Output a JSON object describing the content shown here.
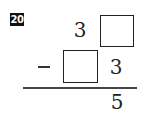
{
  "problem": {
    "number": "20",
    "top_row": {
      "tens": "3",
      "ones_blank": ""
    },
    "operator": "−",
    "bottom_row": {
      "tens_blank": "",
      "ones": "3"
    },
    "result": {
      "ones": "5"
    }
  }
}
